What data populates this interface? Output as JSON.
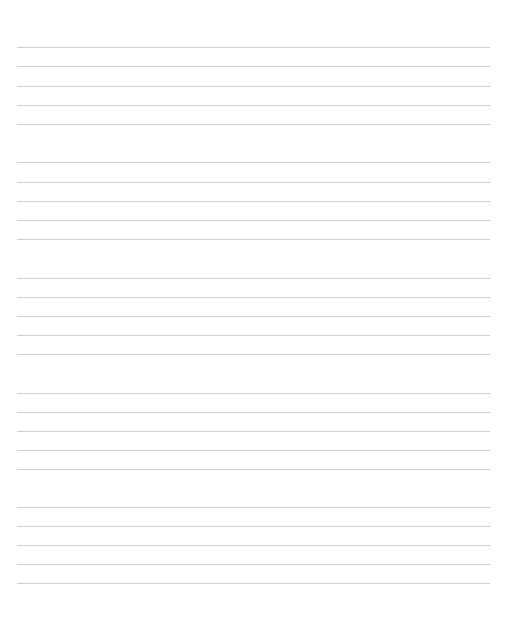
{
  "page": {
    "type": "lined-writing-sheet",
    "line_color": "#cfcfcf",
    "line_x": 17,
    "line_width": 473,
    "groups": [
      {
        "lines": [
          47,
          66,
          86,
          105,
          124
        ]
      },
      {
        "lines": [
          162,
          182,
          201,
          220,
          239
        ]
      },
      {
        "lines": [
          278,
          297,
          316,
          335,
          354
        ]
      },
      {
        "lines": [
          393,
          412,
          431,
          450,
          469
        ]
      },
      {
        "lines": [
          507,
          526,
          545,
          564,
          583
        ]
      }
    ]
  }
}
